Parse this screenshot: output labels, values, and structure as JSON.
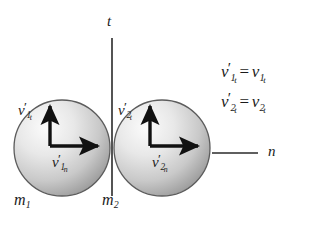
{
  "figure": {
    "background_color": "#ffffff",
    "ink_color": "#1b1b1b"
  },
  "axes": {
    "tangential": {
      "label": "t",
      "orientation": "vertical",
      "x": 112,
      "y_top": 38,
      "y_bottom": 196
    },
    "normal": {
      "label": "n",
      "orientation": "horizontal",
      "y": 153,
      "x_start": 212,
      "x_end": 258
    }
  },
  "bodies": [
    {
      "name": "sphere-1",
      "mass_label": "m",
      "mass_subscript": "1",
      "center_x": 62,
      "center_y": 148,
      "radius": 48,
      "fill_light": "#f2f2f2",
      "fill_dark": "#9a9a9a",
      "stroke": "#555555",
      "vectors": [
        {
          "name": "tangential-velocity",
          "symbol": "v",
          "prime": "′",
          "sub": "1",
          "subsub": "t",
          "direction": "up",
          "label_x": 22,
          "label_y": 108
        },
        {
          "name": "normal-velocity",
          "symbol": "v",
          "prime": "′",
          "sub": "1",
          "subsub": "n",
          "direction": "right",
          "label_x": 58,
          "label_y": 160
        }
      ]
    },
    {
      "name": "sphere-2",
      "mass_label": "m",
      "mass_subscript": "2",
      "center_x": 162,
      "center_y": 148,
      "radius": 48,
      "fill_light": "#f2f2f2",
      "fill_dark": "#9a9a9a",
      "stroke": "#555555",
      "vectors": [
        {
          "name": "tangential-velocity",
          "symbol": "v",
          "prime": "′",
          "sub": "2",
          "subsub": "t",
          "direction": "up",
          "label_x": 122,
          "label_y": 108
        },
        {
          "name": "normal-velocity",
          "symbol": "v",
          "prime": "′",
          "sub": "2",
          "subsub": "n",
          "direction": "right",
          "label_x": 158,
          "label_y": 160
        }
      ]
    }
  ],
  "labels": {
    "mass_1": "m",
    "mass_1_sub": "1",
    "mass_2": "m",
    "mass_2_sub": "2",
    "axis_t": "t",
    "axis_n": "n",
    "v": "v",
    "prime": "′",
    "equals": "=",
    "sub_1": "1",
    "sub_2": "2",
    "sub_t": "t",
    "sub_n": "n"
  },
  "equations": [
    {
      "name": "equation-1",
      "text": "v′1t = v1t",
      "lhs_symbol": "v",
      "lhs_prime": "′",
      "lhs_sub": "1",
      "lhs_subsub": "t",
      "operator": "=",
      "rhs_symbol": "v",
      "rhs_sub": "1",
      "rhs_subsub": "t"
    },
    {
      "name": "equation-2",
      "text": "v′2t = v2t",
      "lhs_symbol": "v",
      "lhs_prime": "′",
      "lhs_sub": "2",
      "lhs_subsub": "t",
      "operator": "=",
      "rhs_symbol": "v",
      "rhs_sub": "2",
      "rhs_subsub": "t"
    }
  ]
}
